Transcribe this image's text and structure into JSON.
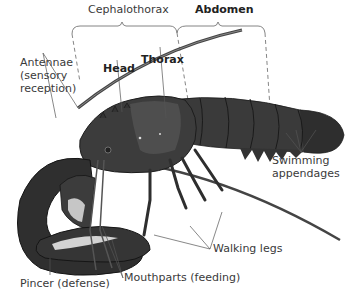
{
  "figure": {
    "labels": {
      "cephalothorax": "Cephalothorax",
      "abdomen": "Abdomen",
      "head": "Head",
      "thorax": "Thorax",
      "antennae_line1": "Antennae",
      "antennae_line2": "(sensory",
      "antennae_line3": "reception)",
      "swimming_line1": "Swimming",
      "swimming_line2": "appendages",
      "walking_legs": "Walking legs",
      "mouthparts": "Mouthparts (feeding)",
      "pincer": "Pincer (defense)"
    },
    "colors": {
      "label_text": "#3a3a3a",
      "leader_line": "#555555",
      "bracket": "#666666",
      "body_dark": "#2b2b2b",
      "body_mid": "#4a4a4a",
      "body_light": "#7a7a7a"
    }
  }
}
